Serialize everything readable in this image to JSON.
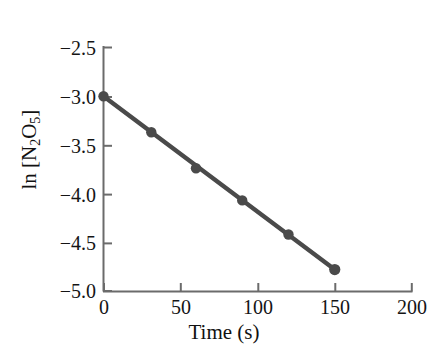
{
  "chart_data": {
    "type": "scatter",
    "title": "",
    "xlabel": "Time (s)",
    "ylabel": "ln [N2O5]",
    "ylabel_parts": {
      "prefix": "ln [N",
      "sub1": "2",
      "mid": "O",
      "sub2": "5",
      "suffix": "]"
    },
    "x": [
      0,
      31,
      60,
      90,
      120,
      150
    ],
    "values": [
      -3.0,
      -3.37,
      -3.74,
      -4.07,
      -4.42,
      -4.78
    ],
    "series": [
      {
        "name": "ln [N2O5] vs time",
        "x": [
          0,
          31,
          60,
          90,
          120,
          150
        ],
        "values": [
          -3.0,
          -3.37,
          -3.74,
          -4.07,
          -4.42,
          -4.78
        ]
      }
    ],
    "fit_line": {
      "x_start": 0,
      "y_start": -3.0,
      "x_end": 150,
      "y_end": -4.78
    },
    "xlim": [
      0,
      200
    ],
    "ylim": [
      -5.0,
      -2.5
    ],
    "xticks": [
      0,
      50,
      100,
      150,
      200
    ],
    "xtick_labels": [
      "0",
      "50",
      "100",
      "150",
      "200"
    ],
    "yticks": [
      -2.5,
      -3.0,
      -3.5,
      -4.0,
      -4.5,
      -5.0
    ],
    "ytick_labels": [
      "−2.5",
      "−3.0",
      "−3.5",
      "−4.0",
      "−4.5",
      "−5.0"
    ],
    "grid": false,
    "legend": "none",
    "colors": {
      "background": "#ffffff",
      "line": "#4a4a4a",
      "marker": "#4a4a4a",
      "axis": "#6b6b6b",
      "text": "#141414"
    }
  }
}
